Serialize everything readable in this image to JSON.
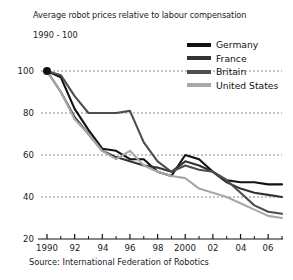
{
  "title": "Average robot prices relative to labour compensation",
  "subtitle": "1990 - 100",
  "source": "Source: International Federation of Robotics",
  "legend": {
    "items": [
      {
        "label": "Germany",
        "color": "#111111"
      },
      {
        "label": "France",
        "color": "#333333"
      },
      {
        "label": "Britain",
        "color": "#4d4d4d"
      },
      {
        "label": "United States",
        "color": "#a8a8a8"
      }
    ]
  },
  "axes": {
    "y_ticks": [
      "100",
      "80",
      "60",
      "40",
      "20"
    ],
    "x_ticks": [
      "1990",
      "92",
      "94",
      "96",
      "98",
      "2000",
      "02",
      "04",
      "06"
    ]
  },
  "chart_data": {
    "type": "line",
    "title": "Average robot prices relative to labour compensation",
    "subtitle": "1990 - 100",
    "xlabel": "",
    "ylabel": "",
    "xlim": [
      1990,
      2007
    ],
    "ylim": [
      20,
      100
    ],
    "ytick_values": [
      100,
      80,
      60,
      40,
      20
    ],
    "xtick_values": [
      1990,
      1992,
      1994,
      1996,
      1998,
      2000,
      2002,
      2004,
      2006
    ],
    "xtick_labels": [
      "1990",
      "92",
      "94",
      "96",
      "98",
      "2000",
      "02",
      "04",
      "06"
    ],
    "grid": "horizontal-dotted",
    "legend_position": "top-right",
    "x": [
      1990,
      1991,
      1992,
      1993,
      1994,
      1995,
      1996,
      1997,
      1998,
      1999,
      2000,
      2001,
      2002,
      2003,
      2004,
      2005,
      2006,
      2007
    ],
    "series": [
      {
        "name": "Germany",
        "color": "#111111",
        "values": [
          100,
          97,
          82,
          72,
          63,
          62,
          58,
          58,
          52,
          50,
          60,
          58,
          52,
          48,
          47,
          47,
          46,
          46
        ]
      },
      {
        "name": "France",
        "color": "#333333",
        "values": [
          100,
          90,
          78,
          70,
          62,
          59,
          57,
          55,
          54,
          52,
          57,
          55,
          52,
          47,
          44,
          42,
          41,
          40
        ]
      },
      {
        "name": "Britain",
        "color": "#4d4d4d",
        "values": [
          100,
          98,
          88,
          80,
          80,
          80,
          81,
          66,
          57,
          52,
          55,
          53,
          52,
          48,
          42,
          36,
          33,
          32
        ]
      },
      {
        "name": "United States",
        "color": "#a8a8a8",
        "values": [
          100,
          90,
          77,
          70,
          62,
          58,
          62,
          55,
          52,
          50,
          49,
          44,
          42,
          40,
          37,
          34,
          31,
          30
        ]
      }
    ]
  }
}
